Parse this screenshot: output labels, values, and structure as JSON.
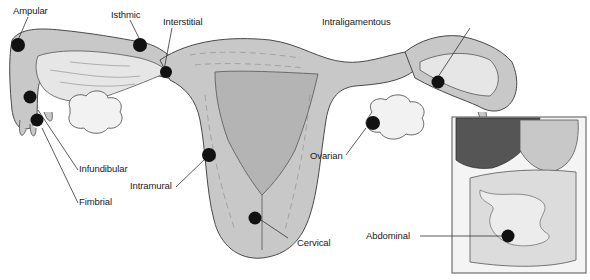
{
  "diagram": {
    "colors": {
      "tissue": "#c8c8c8",
      "tissue_dark": "#b4b4b4",
      "lumen": "#e6e6e6",
      "outline": "#4a4a4a",
      "site_marker": "#111111",
      "liver": "#555555",
      "ovary": "#f2f2f2"
    },
    "labels": {
      "ampular": "Ampular",
      "isthmic": "Isthmic",
      "interstitial": "Interstitial",
      "intraligamentous": "Intraligamentous",
      "infundibular": "Infundibular",
      "fimbrial": "Fimbrial",
      "intramural": "Intramural",
      "ovarian": "Ovarian",
      "cervical": "Cervical",
      "abdominal": "Abdominal"
    }
  }
}
